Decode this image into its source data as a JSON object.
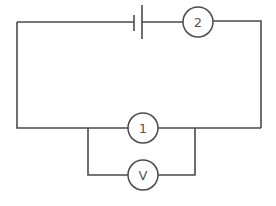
{
  "diagram": {
    "type": "circuit",
    "components": {
      "battery": {
        "label": ""
      },
      "meter_top": {
        "label": "2"
      },
      "meter_middle": {
        "label": "1"
      },
      "voltmeter": {
        "label": "V"
      }
    },
    "colors": {
      "wire": "#4a4a4a",
      "text": "#555555",
      "background": "#ffffff"
    }
  }
}
